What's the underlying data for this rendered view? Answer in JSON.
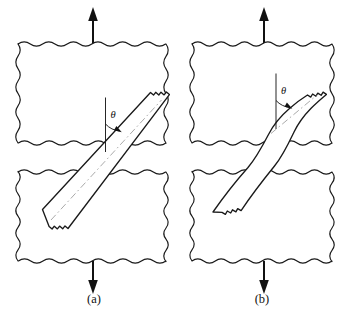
{
  "figure": {
    "domain_type": "diagram",
    "background_color": "#ffffff",
    "line_color": "#1a1a1a",
    "axis_color": "#9a9a9a",
    "panels": [
      {
        "id": "a",
        "caption": "(a)",
        "angle_symbol": "θ",
        "fiber_state": "straight-inclined",
        "fiber_angle_deg": 40,
        "load_arrow_top": "tension-up",
        "load_arrow_bottom": "tension-down",
        "blocks": [
          {
            "name": "upper-matrix-block",
            "x": 18,
            "y": 44,
            "width": 148,
            "height": 99
          },
          {
            "name": "lower-matrix-block",
            "x": 18,
            "y": 172,
            "width": 148,
            "height": 89
          }
        ]
      },
      {
        "id": "b",
        "caption": "(b)",
        "angle_symbol": "θ",
        "fiber_state": "s-curved-bent",
        "fiber_angle_deg": 40,
        "load_arrow_top": "tension-up",
        "load_arrow_bottom": "tension-down",
        "blocks": [
          {
            "name": "upper-matrix-block",
            "x": 192,
            "y": 44,
            "width": 140,
            "height": 99
          },
          {
            "name": "lower-matrix-block",
            "x": 192,
            "y": 172,
            "width": 140,
            "height": 89
          }
        ]
      }
    ]
  }
}
